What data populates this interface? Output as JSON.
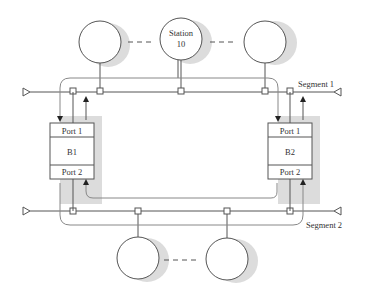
{
  "diagram": {
    "type": "two-segment bridged LAN with two bridges",
    "segments": [
      {
        "id": "segment1",
        "label": "Segment 1"
      },
      {
        "id": "segment2",
        "label": "Segment 2"
      }
    ],
    "bridges": [
      {
        "id": "B1",
        "label": "B1",
        "port_top": "Port 1",
        "port_bottom": "Port 2"
      },
      {
        "id": "B2",
        "label": "B2",
        "port_top": "Port 1",
        "port_bottom": "Port 2"
      }
    ],
    "stations": {
      "segment1": [
        {
          "label": ""
        },
        {
          "label_line1": "Station",
          "label_line2": "10"
        },
        {
          "label": ""
        }
      ],
      "segment2": [
        {
          "label": ""
        },
        {
          "label": ""
        }
      ]
    },
    "colors": {
      "line": "#555555",
      "shadow": "#d9d9d9",
      "node_fill": "#ffffff"
    }
  }
}
